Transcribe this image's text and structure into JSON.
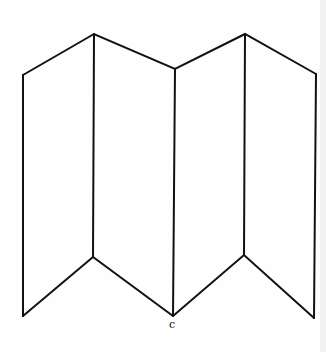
{
  "figure": {
    "panels": 4,
    "stroke_color": "#111111",
    "background": "#fefefe",
    "label": "c",
    "top_vertices": [
      [
        23,
        75
      ],
      [
        94,
        34
      ],
      [
        175,
        69
      ],
      [
        245,
        34
      ],
      [
        316,
        74
      ]
    ],
    "bottom_vertices": [
      [
        23,
        316
      ],
      [
        93,
        257
      ],
      [
        173,
        316
      ],
      [
        244,
        255
      ],
      [
        314,
        318
      ]
    ]
  }
}
